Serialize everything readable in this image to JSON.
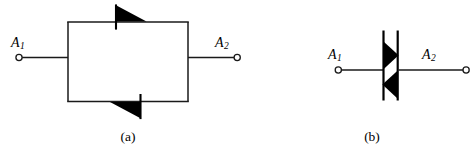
{
  "figure": {
    "width": 473,
    "height": 157,
    "background_color": "#ffffff",
    "line_color": "#1a1a1a",
    "fill_color": "#000000"
  },
  "panel_a": {
    "caption": "(a)",
    "description": "two-antiparallel-diodes",
    "terminal_left": {
      "label_base": "A",
      "label_sub": "1"
    },
    "terminal_right": {
      "label_base": "A",
      "label_sub": "2"
    },
    "components": [
      {
        "name": "diode-top",
        "orientation": "points-right",
        "position": "top-branch"
      },
      {
        "name": "diode-bottom",
        "orientation": "points-right",
        "position": "bottom-branch"
      }
    ]
  },
  "panel_b": {
    "caption": "(b)",
    "description": "triac-symbol",
    "terminal_left": {
      "label_base": "A",
      "label_sub": "1"
    },
    "terminal_right": {
      "label_base": "A",
      "label_sub": "2"
    },
    "components": [
      {
        "name": "triangle-upper",
        "orientation": "points-right"
      },
      {
        "name": "triangle-lower",
        "orientation": "points-left"
      },
      {
        "name": "bar-left",
        "orientation": "vertical"
      },
      {
        "name": "bar-right",
        "orientation": "vertical"
      }
    ]
  }
}
